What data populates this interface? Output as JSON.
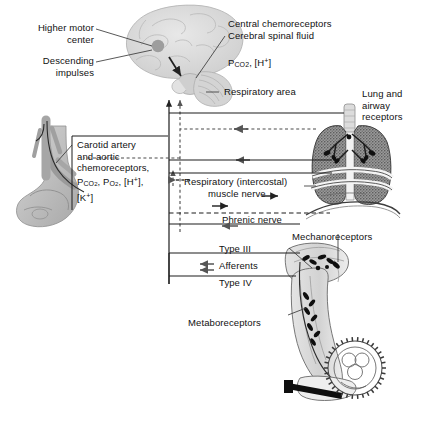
{
  "figure": {
    "type": "physiology-schematic",
    "background_color": "#ffffff",
    "line_color": "#1a1a1a",
    "tissue_fill": "#b9b9b9"
  },
  "labels": {
    "higher_motor_center": "Higher motor\ncenter",
    "descending_impulses": "Descending\nimpulses",
    "central_chemoreceptors": "Central chemoreceptors",
    "cerebral_spinal_fluid": "Cerebral spinal fluid",
    "csf_chemistry_p": "P",
    "csf_chemistry_sub": "CO",
    "csf_chemistry_sub2": "2",
    "csf_chemistry_rest": ", [H",
    "csf_chemistry_sup": "+",
    "csf_chemistry_end": "]",
    "respiratory_area": "Respiratory area",
    "lung_airway_receptors": "Lung and\nairway\nreceptors",
    "carotid_line1": "Carotid artery",
    "carotid_line2": "and aortic",
    "carotid_line3": "chemoreceptors,",
    "respiratory_muscle_nerve_line1": "Respiratory (intercostal)",
    "respiratory_muscle_nerve_line2": "muscle nerve",
    "phrenic_nerve": "Phrenic nerve",
    "mechanoreceptors": "Mechanoreceptors",
    "type_iii": "Type III",
    "afferents": "Afferents",
    "type_iv": "Type IV",
    "metaboreceptors": "Metaboreceptors"
  },
  "chemistry": {
    "carotid_pco2": {
      "symbol": "P",
      "sub": "CO2",
      "sep": ","
    },
    "carotid_po2": {
      "symbol": "P",
      "sub": "O2",
      "sep": ","
    },
    "carotid_h": {
      "text": "[H",
      "sup": "+",
      "end": "],"
    },
    "carotid_k": {
      "text": "[K",
      "sup": "+",
      "end": "]"
    }
  },
  "anatomy": {
    "brain": "brain-sagittal-illustration",
    "heart": "heart-aorta-carotid-illustration",
    "lungs": "lungs-trachea-diaphragm-illustration",
    "leg": "leg-on-bicycle-pedal-illustration"
  },
  "flow": {
    "afferent_style": "dashed",
    "efferent_style": "solid",
    "afferent_direction": "toward-respiratory-area",
    "efferent_direction": "toward-effector-muscles"
  }
}
